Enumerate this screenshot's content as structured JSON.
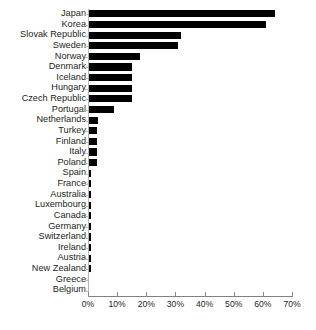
{
  "chart_data": {
    "type": "bar",
    "orientation": "horizontal",
    "title": "",
    "xlabel": "",
    "ylabel": "",
    "xlim": [
      0,
      70
    ],
    "xticks": [
      0,
      10,
      20,
      30,
      40,
      50,
      60,
      70
    ],
    "xtick_labels": [
      "0%",
      "10%",
      "20%",
      "30%",
      "40%",
      "50%",
      "60%",
      "70%"
    ],
    "grid": false,
    "legend": null,
    "bar_color": "#000000",
    "axis_color": "#808080",
    "categories": [
      "Japan",
      "Korea",
      "Slovak Republic",
      "Sweden",
      "Norway",
      "Denmark",
      "Iceland",
      "Hungary",
      "Czech Republic",
      "Portugal",
      "Netherlands",
      "Turkey",
      "Finland",
      "Italy",
      "Poland",
      "Spain",
      "France",
      "Australia",
      "Luxembourg",
      "Canada",
      "Germany",
      "Switzerland",
      "Ireland",
      "Austria",
      "New Zealand",
      "Greece",
      "Belgium"
    ],
    "values": [
      64.0,
      61.0,
      32.0,
      31.0,
      18.0,
      15.0,
      15.0,
      15.0,
      15.0,
      9.0,
      3.5,
      3.0,
      3.0,
      3.0,
      3.0,
      1.0,
      1.0,
      1.0,
      1.0,
      1.0,
      1.0,
      1.0,
      1.0,
      1.0,
      1.0,
      0.0,
      0.0
    ],
    "source_note": ""
  }
}
